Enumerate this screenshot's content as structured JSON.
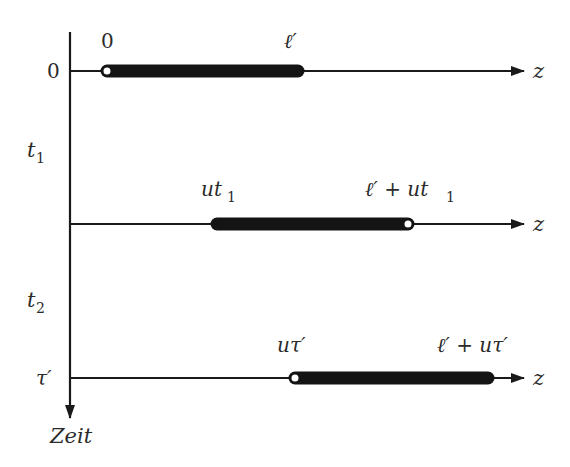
{
  "diagram": {
    "type": "space-time diagram of a moving rod",
    "colors": {
      "ink": "#1a1a1a",
      "rod": "#141414",
      "background": "#ffffff",
      "label": "#2a2a2a"
    },
    "time_axis": {
      "label": "Zeit",
      "ticks": [
        {
          "label": "0",
          "y": 71
        },
        {
          "label": "τ′",
          "y": 378
        }
      ],
      "interval_labels": [
        {
          "label": "t",
          "sub": "1",
          "y": 150
        },
        {
          "label": "t",
          "sub": "2",
          "y": 300
        }
      ]
    },
    "rows": [
      {
        "id": "row-0",
        "axis_label": "z",
        "left_label": "0",
        "right_label_main": "ℓ′",
        "right_label_rest": "",
        "left_label_rest": "",
        "rod_start_x": 107,
        "rod_end_x": 298,
        "open_end": "left",
        "y": 71
      },
      {
        "id": "row-t1",
        "axis_label": "z",
        "left_label": "ut",
        "left_label_sub": "1",
        "right_label_main": "ℓ′ + ut",
        "right_label_sub": "1",
        "rod_start_x": 217,
        "rod_end_x": 408,
        "open_end": "right",
        "y": 224
      },
      {
        "id": "row-tau",
        "axis_label": "z",
        "left_label": "uτ′",
        "right_label_main": "ℓ′ + uτ′",
        "rod_start_x": 295,
        "rod_end_x": 488,
        "open_end": "left",
        "y": 378
      }
    ]
  }
}
